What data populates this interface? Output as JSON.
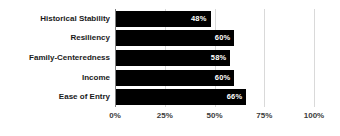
{
  "chart_data": {
    "type": "bar",
    "orientation": "horizontal",
    "title": "",
    "xlabel": "",
    "ylabel": "",
    "categories": [
      "Historical Stability",
      "Resiliency",
      "Family-Centeredness",
      "Income",
      "Ease of Entry"
    ],
    "values": [
      48,
      60,
      58,
      60,
      66
    ],
    "data_labels": [
      "48%",
      "60%",
      "58%",
      "60%",
      "66%"
    ],
    "xlim": [
      0,
      100
    ],
    "xticks": [
      0,
      25,
      50,
      75,
      100
    ],
    "xtick_labels": [
      "0%",
      "25%",
      "50%",
      "75%",
      "100%"
    ],
    "grid": true,
    "legend": false,
    "colors": {
      "bar": "#000000",
      "data_label": "#ffffff",
      "category_label": "#1a1a1a",
      "tick_label": "#3b3b3b",
      "gridline": "#d9d9d9",
      "axis": "#808080",
      "background": "#ffffff"
    }
  }
}
